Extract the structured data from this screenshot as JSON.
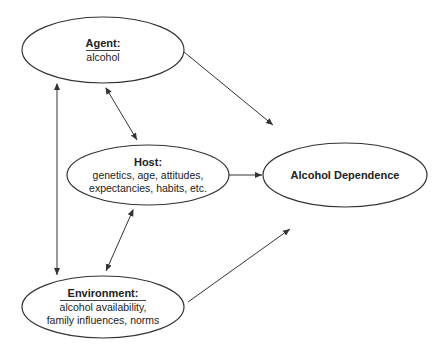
{
  "diagram": {
    "nodes": {
      "agent": {
        "title": "Agent:",
        "lines": [
          "alcohol"
        ]
      },
      "host": {
        "title": "Host:",
        "lines": [
          "genetics, age, attitudes,",
          "expectancies, habits, etc."
        ]
      },
      "environment": {
        "title": "Environment:",
        "lines": [
          "alcohol availability,",
          "family influences, norms"
        ]
      },
      "outcome": {
        "title": "Alcohol Dependence",
        "lines": []
      }
    },
    "edges": [
      {
        "from": "agent",
        "to": "outcome",
        "type": "directed"
      },
      {
        "from": "host",
        "to": "outcome",
        "type": "directed"
      },
      {
        "from": "environment",
        "to": "outcome",
        "type": "directed"
      },
      {
        "from": "agent",
        "to": "host",
        "type": "bidirectional"
      },
      {
        "from": "host",
        "to": "environment",
        "type": "bidirectional"
      },
      {
        "from": "agent",
        "to": "environment",
        "type": "bidirectional"
      }
    ],
    "colors": {
      "stroke": "#333333",
      "background": "#ffffff"
    }
  }
}
